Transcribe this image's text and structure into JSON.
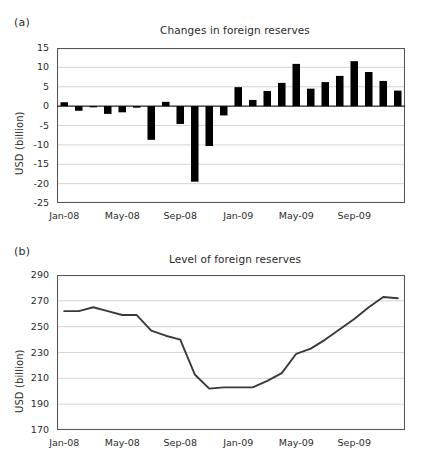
{
  "figure": {
    "panels": [
      {
        "letter": "(a)",
        "title": "Changes in foreign reserves",
        "ylabel": "USD (billion)"
      },
      {
        "letter": "(b)",
        "title": "Level of foreign reserves",
        "ylabel": "USD (billion)"
      }
    ]
  },
  "chart_data": [
    {
      "type": "bar",
      "title": "Changes in foreign reserves",
      "xlabel": "",
      "ylabel": "USD (billion)",
      "ylim": [
        -25,
        15
      ],
      "yticks": [
        15,
        10,
        5,
        0,
        -5,
        -10,
        -15,
        -20,
        -25
      ],
      "ytick_labels": [
        "15",
        "10",
        "5",
        "0",
        "-5",
        "-10",
        "-15",
        "-20",
        "-25"
      ],
      "xtick_labels": [
        "Jan-08",
        "May-08",
        "Sep-08",
        "Jan-09",
        "May-09",
        "Sep-09"
      ],
      "xtick_indices": [
        0,
        4,
        8,
        12,
        16,
        20
      ],
      "grid": true,
      "bar_color": "#000000",
      "categories": [
        "Jan-08",
        "Feb-08",
        "Mar-08",
        "Apr-08",
        "May-08",
        "Jun-08",
        "Jul-08",
        "Aug-08",
        "Sep-08",
        "Oct-08",
        "Nov-08",
        "Dec-08",
        "Jan-09",
        "Feb-09",
        "Mar-09",
        "Apr-09",
        "May-09",
        "Jun-09",
        "Jul-09",
        "Aug-09",
        "Sep-09",
        "Oct-09",
        "Nov-09",
        "Dec-09"
      ],
      "values": [
        1.0,
        -1.2,
        -0.3,
        -2.0,
        -1.6,
        -0.4,
        -8.7,
        1.1,
        -4.6,
        -19.5,
        -10.3,
        -2.4,
        4.9,
        1.6,
        3.9,
        6.0,
        10.9,
        4.5,
        6.2,
        7.8,
        11.6,
        8.8,
        6.5,
        4.0
      ]
    },
    {
      "type": "line",
      "title": "Level of foreign reserves",
      "xlabel": "",
      "ylabel": "USD (billion)",
      "ylim": [
        170,
        290
      ],
      "yticks": [
        290,
        270,
        250,
        230,
        210,
        190,
        170
      ],
      "ytick_labels": [
        "290",
        "270",
        "250",
        "230",
        "210",
        "190",
        "170"
      ],
      "xtick_labels": [
        "Jan-08",
        "May-08",
        "Sep-08",
        "Jan-09",
        "May-09",
        "Sep-09"
      ],
      "xtick_indices": [
        0,
        4,
        8,
        12,
        16,
        20
      ],
      "grid": true,
      "line_color": "#3a3a3a",
      "categories": [
        "Jan-08",
        "Feb-08",
        "Mar-08",
        "Apr-08",
        "May-08",
        "Jun-08",
        "Jul-08",
        "Aug-08",
        "Sep-08",
        "Oct-08",
        "Nov-08",
        "Dec-08",
        "Jan-09",
        "Feb-09",
        "Mar-09",
        "Apr-09",
        "May-09",
        "Jun-09",
        "Jul-09",
        "Aug-09",
        "Sep-09",
        "Oct-09",
        "Nov-09",
        "Dec-09"
      ],
      "values": [
        262,
        262,
        265,
        262,
        259,
        259,
        247,
        243,
        240,
        213,
        202,
        203,
        203,
        203,
        208,
        214,
        229,
        233,
        240,
        248,
        256,
        265,
        273,
        272
      ]
    }
  ]
}
